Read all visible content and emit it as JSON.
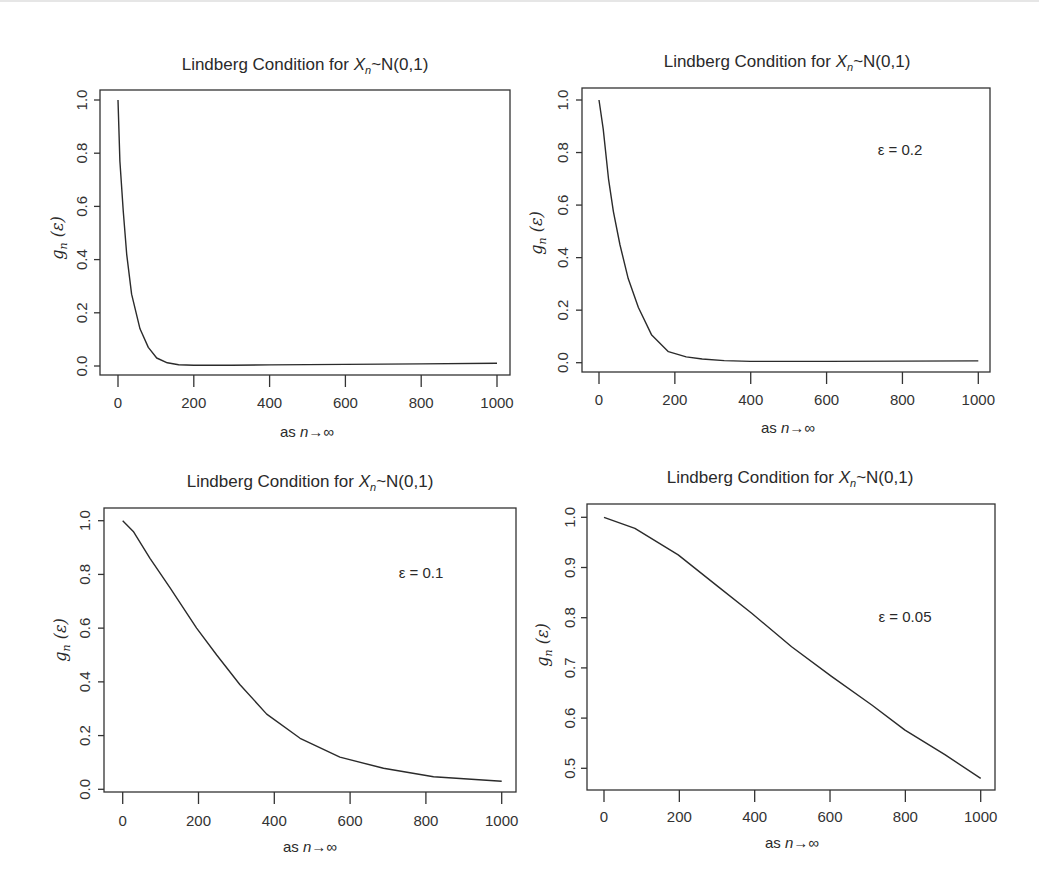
{
  "figure": {
    "panels": [
      {
        "id": "top-left",
        "title_prefix": "Lindberg Condition for ",
        "title_var": "X",
        "title_sub": "n",
        "title_suffix": "~N(0,1)",
        "ylabel_main": "g",
        "ylabel_sub": "n",
        "ylabel_arg": " (ε)",
        "xlabel_prefix": "as ",
        "xlabel_var": "n",
        "xlabel_suffix": "→∞",
        "annotation": ""
      },
      {
        "id": "top-right",
        "title_prefix": "Lindberg Condition for ",
        "title_var": "X",
        "title_sub": "n",
        "title_suffix": "~N(0,1)",
        "ylabel_main": "g",
        "ylabel_sub": "n",
        "ylabel_arg": " (ε)",
        "xlabel_prefix": "as ",
        "xlabel_var": "n",
        "xlabel_suffix": "→∞",
        "annotation": "ε = 0.2"
      },
      {
        "id": "bottom-left",
        "title_prefix": "Lindberg Condition for  ",
        "title_var": "X",
        "title_sub": "n",
        "title_suffix": "~N(0,1)",
        "ylabel_main": "g",
        "ylabel_sub": "n",
        "ylabel_arg": " (ε)",
        "xlabel_prefix": "as ",
        "xlabel_var": "n",
        "xlabel_suffix": "→∞",
        "annotation": "ε = 0.1"
      },
      {
        "id": "bottom-right",
        "title_prefix": "Lindberg Condition for  ",
        "title_var": "X",
        "title_sub": "n",
        "title_suffix": "~N(0,1)",
        "ylabel_main": "g",
        "ylabel_sub": "n",
        "ylabel_arg": " (ε)",
        "xlabel_prefix": "as ",
        "xlabel_var": "n",
        "xlabel_suffix": "→∞",
        "annotation": "ε = 0.05"
      }
    ]
  },
  "chart_data": [
    {
      "type": "line",
      "title": "Lindberg Condition for X_n~N(0,1)",
      "xlabel": "as n→∞",
      "ylabel": "g_n (ε)",
      "annotation": "",
      "xlim": [
        0,
        1000
      ],
      "ylim": [
        0.0,
        1.0
      ],
      "xticks": [
        0,
        200,
        400,
        600,
        800,
        1000
      ],
      "yticks": [
        0.0,
        0.2,
        0.4,
        0.6,
        0.8,
        1.0
      ],
      "ytick_labels": [
        "0.0",
        "0.2",
        "0.4",
        "0.6",
        "0.8",
        "1.0"
      ],
      "grid": false,
      "x": [
        0,
        5,
        14,
        23,
        36,
        58,
        80,
        102,
        130,
        160,
        200,
        300,
        400,
        600,
        800,
        1000
      ],
      "y": [
        1.0,
        0.77,
        0.58,
        0.42,
        0.27,
        0.14,
        0.07,
        0.03,
        0.012,
        0.005,
        0.003,
        0.003,
        0.004,
        0.006,
        0.008,
        0.01
      ]
    },
    {
      "type": "line",
      "title": "Lindberg Condition for X_n~N(0,1)",
      "xlabel": "as n→∞",
      "ylabel": "g_n (ε)",
      "annotation": "ε = 0.2",
      "xlim": [
        0,
        1000
      ],
      "ylim": [
        0.0,
        1.0
      ],
      "xticks": [
        0,
        200,
        400,
        600,
        800,
        1000
      ],
      "yticks": [
        0.0,
        0.2,
        0.4,
        0.6,
        0.8,
        1.0
      ],
      "ytick_labels": [
        "0.0",
        "0.2",
        "0.4",
        "0.6",
        "0.8",
        "1.0"
      ],
      "grid": false,
      "x": [
        0,
        11,
        25,
        38,
        55,
        77,
        104,
        139,
        183,
        230,
        272,
        330,
        400,
        600,
        800,
        1000
      ],
      "y": [
        1.0,
        0.89,
        0.7,
        0.575,
        0.45,
        0.32,
        0.21,
        0.105,
        0.042,
        0.022,
        0.014,
        0.008,
        0.005,
        0.005,
        0.006,
        0.007
      ]
    },
    {
      "type": "line",
      "title": "Lindberg Condition for X_n~N(0,1)",
      "xlabel": "as n→∞",
      "ylabel": "g_n (ε)",
      "annotation": "ε = 0.1",
      "xlim": [
        0,
        1000
      ],
      "ylim": [
        0.0,
        1.0
      ],
      "xticks": [
        0,
        200,
        400,
        600,
        800,
        1000
      ],
      "yticks": [
        0.0,
        0.2,
        0.4,
        0.6,
        0.8,
        1.0
      ],
      "ytick_labels": [
        "0.0",
        "0.2",
        "0.4",
        "0.6",
        "0.8",
        "1.0"
      ],
      "grid": false,
      "x": [
        0,
        28,
        72,
        125,
        195,
        248,
        309,
        380,
        468,
        573,
        688,
        820,
        1000
      ],
      "y": [
        1.0,
        0.96,
        0.86,
        0.75,
        0.6,
        0.5,
        0.39,
        0.28,
        0.19,
        0.12,
        0.078,
        0.047,
        0.03
      ]
    },
    {
      "type": "line",
      "title": "Lindberg Condition for X_n~N(0,1)",
      "xlabel": "as n→∞",
      "ylabel": "g_n (ε)",
      "annotation": "ε = 0.05",
      "xlim": [
        0,
        1000
      ],
      "ylim": [
        0.5,
        1.0
      ],
      "xticks": [
        0,
        200,
        400,
        600,
        800,
        1000
      ],
      "yticks": [
        0.5,
        0.6,
        0.7,
        0.8,
        0.9,
        1.0
      ],
      "ytick_labels": [
        "0.5",
        "0.6",
        "0.7",
        "0.8",
        "0.9",
        "1.0"
      ],
      "grid": false,
      "x": [
        0,
        82,
        197,
        303,
        392,
        498,
        604,
        711,
        799,
        905,
        1000
      ],
      "y": [
        1.0,
        0.978,
        0.925,
        0.862,
        0.809,
        0.742,
        0.683,
        0.626,
        0.576,
        0.527,
        0.48
      ]
    }
  ]
}
